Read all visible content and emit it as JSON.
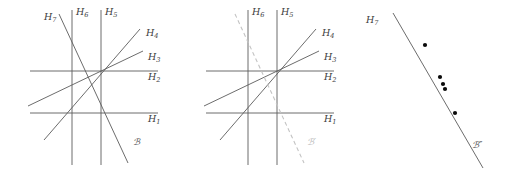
{
  "figure": {
    "kind": "line-arrangement-diagram",
    "panel_count": 3,
    "colors": {
      "line": "#5b5b5b",
      "line_light": "#6e6e6e",
      "dashed_line": "#c3c3c3",
      "dot": "#0a0a0a",
      "label": "#3c3c3c",
      "label_ghost": "#b9b9b9",
      "background": "#ffffff"
    }
  },
  "panels": [
    {
      "id": "panel-left",
      "name": "arrangement-with-H7",
      "center": {
        "x": 101,
        "y": 71
      },
      "labels": {
        "h1": {
          "base": "H",
          "sub": "1",
          "x": 148,
          "y": 122
        },
        "h2": {
          "base": "H",
          "sub": "2",
          "x": 148,
          "y": 80
        },
        "h3": {
          "base": "H",
          "sub": "3",
          "x": 148,
          "y": 60
        },
        "h4": {
          "base": "H",
          "sub": "4",
          "x": 146,
          "y": 36
        },
        "h5": {
          "base": "H",
          "sub": "5",
          "x": 105,
          "y": 15
        },
        "h6": {
          "base": "H",
          "sub": "6",
          "x": 76,
          "y": 15
        },
        "h7": {
          "base": "H",
          "sub": "7",
          "x": 47,
          "y": 19
        },
        "curve": {
          "text": "ℬ",
          "x": 133,
          "y": 145
        }
      }
    },
    {
      "id": "panel-middle",
      "name": "arrangement-with-Cprime",
      "center": {
        "x": 101,
        "y": 71
      },
      "labels": {
        "h1": {
          "base": "H",
          "sub": "1",
          "x": 148,
          "y": 122
        },
        "h2": {
          "base": "H",
          "sub": "2",
          "x": 148,
          "y": 80
        },
        "h3": {
          "base": "H",
          "sub": "3",
          "x": 148,
          "y": 60
        },
        "h4": {
          "base": "H",
          "sub": "4",
          "x": 146,
          "y": 36
        },
        "h5": {
          "base": "H",
          "sub": "5",
          "x": 105,
          "y": 15
        },
        "h6": {
          "base": "H",
          "sub": "6",
          "x": 76,
          "y": 15
        },
        "curve_prime": {
          "text": "ℬ′",
          "x": 131,
          "y": 145
        }
      }
    },
    {
      "id": "panel-right",
      "name": "line-with-marked-points",
      "labels": {
        "h7": {
          "base": "H",
          "sub": "7",
          "x": 17,
          "y": 22
        },
        "curve_double_prime": {
          "text": "ℬ″",
          "x": 122,
          "y": 148
        }
      },
      "marked_point_count": 5,
      "marked_points": [
        {
          "x": 73,
          "y": 45
        },
        {
          "x": 88,
          "y": 77
        },
        {
          "x": 91,
          "y": 84
        },
        {
          "x": 93,
          "y": 89
        },
        {
          "x": 103,
          "y": 113
        }
      ]
    }
  ],
  "geometry": {
    "panel_left": {
      "lines": [
        {
          "name": "H1",
          "kind": "horizontal",
          "x1": 30,
          "y1": 113,
          "x2": 158,
          "y2": 113
        },
        {
          "name": "H2",
          "kind": "horizontal",
          "x1": 30,
          "y1": 71,
          "x2": 158,
          "y2": 71
        },
        {
          "name": "H3",
          "kind": "oblique",
          "x1": 28,
          "y1": 107,
          "x2": 143,
          "y2": 52
        },
        {
          "name": "H4",
          "kind": "oblique",
          "x1": 44,
          "y1": 139,
          "x2": 141,
          "y2": 29
        },
        {
          "name": "H5",
          "kind": "vertical",
          "x1": 101,
          "y1": 10,
          "x2": 101,
          "y2": 165
        },
        {
          "name": "H6",
          "kind": "vertical",
          "x1": 72,
          "y1": 10,
          "x2": 72,
          "y2": 165
        },
        {
          "name": "H7",
          "kind": "steep-neg",
          "x1": 59,
          "y1": 14,
          "x2": 128,
          "y2": 163
        },
        {
          "name": "C",
          "kind": "label-only"
        }
      ]
    },
    "panel_middle": {
      "lines": [
        {
          "name": "H1",
          "kind": "horizontal",
          "x1": 30,
          "y1": 113,
          "x2": 158,
          "y2": 113
        },
        {
          "name": "H2",
          "kind": "horizontal",
          "x1": 30,
          "y1": 71,
          "x2": 158,
          "y2": 71
        },
        {
          "name": "H3",
          "kind": "oblique",
          "x1": 28,
          "y1": 107,
          "x2": 143,
          "y2": 52
        },
        {
          "name": "H4",
          "kind": "oblique",
          "x1": 44,
          "y1": 139,
          "x2": 141,
          "y2": 29
        },
        {
          "name": "H5",
          "kind": "vertical",
          "x1": 101,
          "y1": 10,
          "x2": 101,
          "y2": 165
        },
        {
          "name": "H6",
          "kind": "vertical",
          "x1": 72,
          "y1": 10,
          "x2": 72,
          "y2": 165
        },
        {
          "name": "Cprime",
          "kind": "dashed-steep-neg",
          "x1": 59,
          "y1": 14,
          "x2": 128,
          "y2": 163
        }
      ]
    },
    "panel_right": {
      "lines": [
        {
          "name": "H7",
          "kind": "steep-neg",
          "x1": 41,
          "y1": 13,
          "x2": 131,
          "y2": 168
        }
      ]
    }
  }
}
